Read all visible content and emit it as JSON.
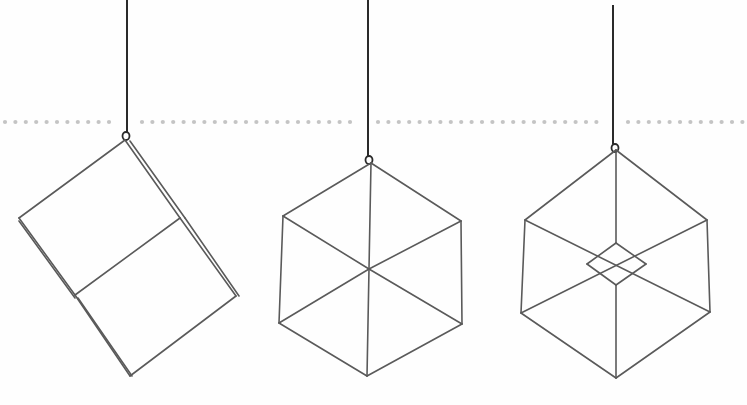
{
  "scene": {
    "description": "Three hanging geometric wire cube ornaments on white background",
    "background": "#fefefe",
    "wire_color": "#5a5a5a",
    "string_color": "#2a2a2a",
    "dot_color": "#c4c4c4"
  },
  "dotted_line": {
    "y": 122,
    "segments": [
      {
        "x1": 5,
        "x2": 115
      },
      {
        "x1": 142,
        "x2": 360
      },
      {
        "x1": 378,
        "x2": 600
      },
      {
        "x1": 628,
        "x2": 747
      }
    ],
    "spacing": 10.4,
    "radius": 2.1
  },
  "ornaments": [
    {
      "name": "tilted-cube",
      "string": {
        "x1": 127,
        "y1": 0,
        "x2": 127,
        "y2": 133
      },
      "hook": {
        "cx": 126,
        "cy": 136
      },
      "edges": [
        [
          125,
          140,
          19,
          218
        ],
        [
          19,
          218,
          75,
          295
        ],
        [
          75,
          295,
          130,
          376
        ],
        [
          130,
          376,
          236,
          296
        ],
        [
          236,
          296,
          180,
          218
        ],
        [
          180,
          218,
          125,
          140
        ],
        [
          75,
          295,
          180,
          218
        ],
        [
          130,
          141,
          185,
          218
        ],
        [
          185,
          218,
          239,
          296
        ],
        [
          19,
          221,
          75,
          298
        ],
        [
          78,
          298,
          132,
          376
        ]
      ]
    },
    {
      "name": "hexagon-cube",
      "string": {
        "x1": 368,
        "y1": 0,
        "x2": 368,
        "y2": 156
      },
      "hook": {
        "cx": 369,
        "cy": 160
      },
      "edges": [
        [
          371,
          163,
          283,
          216
        ],
        [
          283,
          216,
          279,
          323
        ],
        [
          279,
          323,
          367,
          376
        ],
        [
          367,
          376,
          462,
          324
        ],
        [
          462,
          324,
          461,
          221
        ],
        [
          461,
          221,
          371,
          163
        ],
        [
          371,
          163,
          369,
          269
        ],
        [
          283,
          216,
          369,
          269
        ],
        [
          461,
          221,
          369,
          269
        ],
        [
          279,
          323,
          369,
          269
        ],
        [
          462,
          324,
          369,
          269
        ],
        [
          367,
          376,
          369,
          269
        ]
      ]
    },
    {
      "name": "inner-diamond-cube",
      "string": {
        "x1": 613,
        "y1": 5,
        "x2": 613,
        "y2": 144
      },
      "hook": {
        "cx": 615,
        "cy": 148
      },
      "edges": [
        [
          616,
          150,
          525,
          220
        ],
        [
          525,
          220,
          521,
          313
        ],
        [
          521,
          313,
          616,
          378
        ],
        [
          616,
          378,
          710,
          312
        ],
        [
          710,
          312,
          707,
          220
        ],
        [
          707,
          220,
          616,
          150
        ],
        [
          616,
          150,
          616,
          243
        ],
        [
          616,
          285,
          616,
          378
        ],
        [
          525,
          220,
          710,
          312
        ],
        [
          707,
          220,
          521,
          313
        ],
        [
          616,
          243,
          587,
          264
        ],
        [
          616,
          243,
          646,
          264
        ],
        [
          587,
          264,
          616,
          285
        ],
        [
          646,
          264,
          616,
          285
        ]
      ]
    }
  ]
}
